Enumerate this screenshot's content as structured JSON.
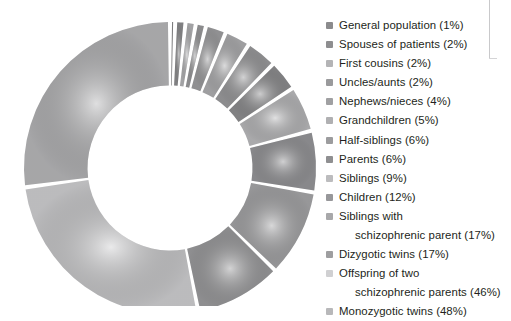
{
  "chart_data": {
    "type": "pie",
    "variant": "donut",
    "title": "",
    "subtitle": "",
    "xlabel": "",
    "ylabel": "",
    "unit": "%",
    "value_suffix": "%",
    "start_angle_deg": 0,
    "direction": "clockwise",
    "inner_radius_ratio": 0.565,
    "legend_position": "right",
    "grid": false,
    "slice_gap_deg": 1.6,
    "total_percent": 177,
    "categories": [
      "General population",
      "Spouses of patients",
      "First cousins",
      "Uncles/aunts",
      "Nephews/nieces",
      "Grandchildren",
      "Half-siblings",
      "Parents",
      "Siblings",
      "Children",
      "Siblings with schizophrenic parent",
      "Dizygotic twins",
      "Offspring of two schizophrenic parents",
      "Monozygotic twins"
    ],
    "values": [
      1,
      2,
      2,
      2,
      4,
      5,
      6,
      6,
      9,
      12,
      17,
      17,
      46,
      48
    ],
    "colors": [
      "#8b8b8d",
      "#8e8e90",
      "#b4b4b6",
      "#9a9a9c",
      "#a0a0a2",
      "#b0b0b2",
      "#9c9c9e",
      "#8f8f91",
      "#bcbcbe",
      "#97979a",
      "#a8a8aa",
      "#9e9ea0",
      "#d0d0d2",
      "#b8b8ba"
    ]
  },
  "legend": {
    "items": [
      {
        "label": "General population (1%)",
        "swatch": "#8b8b8d",
        "wrapped": false,
        "line1": "",
        "line2": ""
      },
      {
        "label": "Spouses of patients (2%)",
        "swatch": "#8e8e90",
        "wrapped": false,
        "line1": "",
        "line2": ""
      },
      {
        "label": "First cousins (2%)",
        "swatch": "#b4b4b6",
        "wrapped": false,
        "line1": "",
        "line2": ""
      },
      {
        "label": "Uncles/aunts (2%)",
        "swatch": "#9a9a9c",
        "wrapped": false,
        "line1": "",
        "line2": ""
      },
      {
        "label": "Nephews/nieces (4%)",
        "swatch": "#a0a0a2",
        "wrapped": false,
        "line1": "",
        "line2": ""
      },
      {
        "label": "Grandchildren (5%)",
        "swatch": "#b0b0b2",
        "wrapped": false,
        "line1": "",
        "line2": ""
      },
      {
        "label": "Half-siblings (6%)",
        "swatch": "#9c9c9e",
        "wrapped": false,
        "line1": "",
        "line2": ""
      },
      {
        "label": "Parents (6%)",
        "swatch": "#8f8f91",
        "wrapped": false,
        "line1": "",
        "line2": ""
      },
      {
        "label": "Siblings (9%)",
        "swatch": "#bcbcbe",
        "wrapped": false,
        "line1": "",
        "line2": ""
      },
      {
        "label": "Children (12%)",
        "swatch": "#97979a",
        "wrapped": false,
        "line1": "",
        "line2": ""
      },
      {
        "label": "Siblings with schizophrenic parent (17%)",
        "swatch": "#a8a8aa",
        "wrapped": true,
        "line1": "Siblings with",
        "line2": "schizophrenic parent (17%)"
      },
      {
        "label": "Dizygotic twins (17%)",
        "swatch": "#9e9ea0",
        "wrapped": false,
        "line1": "",
        "line2": ""
      },
      {
        "label": "Offspring of two schizophrenic parents (46%)",
        "swatch": "#d0d0d2",
        "wrapped": true,
        "line1": "Offspring of two",
        "line2": "schizophrenic parents (46%)"
      },
      {
        "label": "Monozygotic twins (48%)",
        "swatch": "#b8b8ba",
        "wrapped": false,
        "line1": "",
        "line2": ""
      }
    ]
  }
}
